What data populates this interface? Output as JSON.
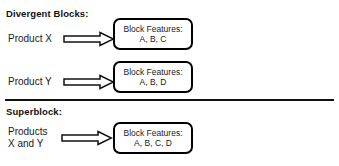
{
  "diagram": {
    "title_divergent": "Divergent Blocks:",
    "title_superblock": "Superblock:",
    "divider_color": "#111111",
    "box_border_color": "#000000",
    "text_color": "#1a1a1a",
    "arrow_icon_name": "right-block-arrow-icon",
    "rows": [
      {
        "source_label": "Product X",
        "source_label_line2": "",
        "box_title": "Block Features:",
        "box_features": "A, B, C"
      },
      {
        "source_label": "Product Y",
        "source_label_line2": "",
        "box_title": "Block Features:",
        "box_features": "A, B, D"
      },
      {
        "source_label": "Products",
        "source_label_line2": "X and Y",
        "box_title": "Block Features:",
        "box_features": "A, B, C, D"
      }
    ]
  }
}
